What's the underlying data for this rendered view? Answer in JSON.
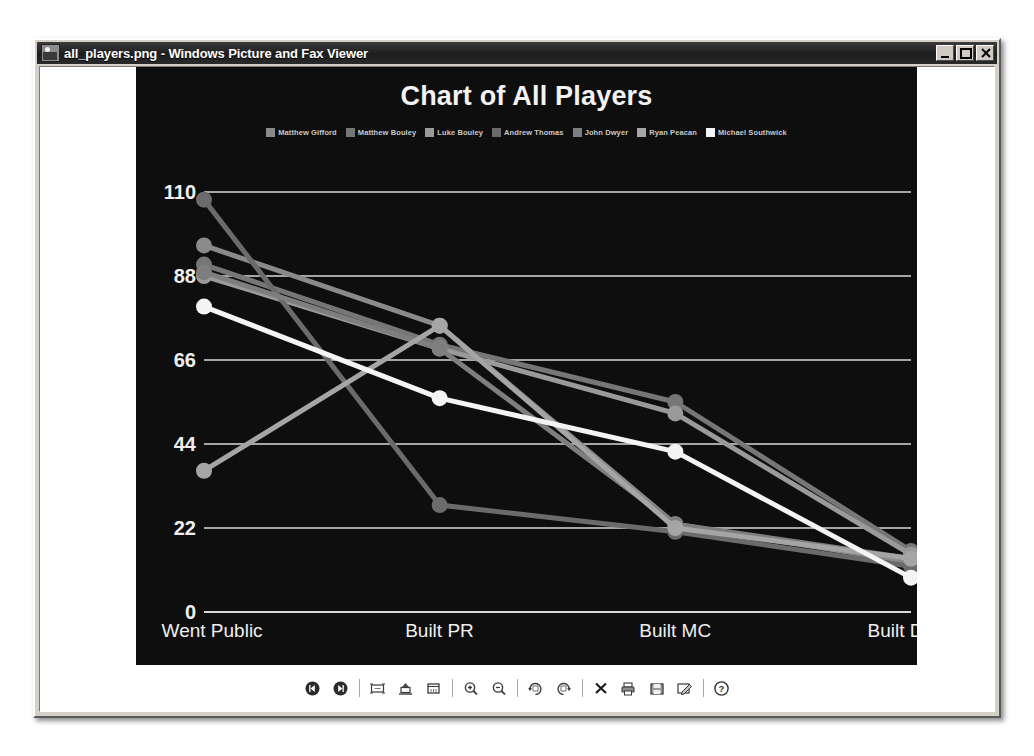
{
  "window": {
    "title": "all_players.png - Windows Picture and Fax Viewer",
    "icon": "image-file-icon",
    "buttons": {
      "minimize": "Minimize",
      "maximize": "Maximize",
      "close": "Close"
    }
  },
  "toolbar": {
    "items": [
      {
        "name": "previous-image-button",
        "label": "Previous Image",
        "icon": "skip-back-icon"
      },
      {
        "name": "next-image-button",
        "label": "Next Image",
        "icon": "skip-forward-icon"
      },
      {
        "name": "separator-1",
        "label": "",
        "icon": "separator"
      },
      {
        "name": "best-fit-button",
        "label": "Best Fit",
        "icon": "best-fit-icon"
      },
      {
        "name": "actual-size-button",
        "label": "Actual Size",
        "icon": "actual-size-icon"
      },
      {
        "name": "start-slideshow-button",
        "label": "Start Slide Show",
        "icon": "slideshow-icon"
      },
      {
        "name": "separator-2",
        "label": "",
        "icon": "separator"
      },
      {
        "name": "zoom-in-button",
        "label": "Zoom In",
        "icon": "magnifier-plus-icon"
      },
      {
        "name": "zoom-out-button",
        "label": "Zoom Out",
        "icon": "magnifier-minus-icon"
      },
      {
        "name": "separator-3",
        "label": "",
        "icon": "separator"
      },
      {
        "name": "rotate-clockwise-button",
        "label": "Rotate Clockwise",
        "icon": "rotate-cw-icon"
      },
      {
        "name": "rotate-counterclockwise-button",
        "label": "Rotate Counter Clockwise",
        "icon": "rotate-ccw-icon"
      },
      {
        "name": "separator-4",
        "label": "",
        "icon": "separator"
      },
      {
        "name": "delete-button",
        "label": "Delete",
        "icon": "close-x-icon"
      },
      {
        "name": "print-button",
        "label": "Print",
        "icon": "printer-icon"
      },
      {
        "name": "copy-to-button",
        "label": "Copy To",
        "icon": "save-disk-icon"
      },
      {
        "name": "edit-button",
        "label": "Edit",
        "icon": "edit-pencil-icon"
      },
      {
        "name": "separator-5",
        "label": "",
        "icon": "separator"
      },
      {
        "name": "help-button",
        "label": "Help",
        "icon": "question-help-icon"
      }
    ]
  },
  "chart_data": {
    "type": "line",
    "title": "Chart of All Players",
    "xlabel": "",
    "ylabel": "",
    "categories": [
      "Went Public",
      "Built PR",
      "Built MC",
      "Built DC"
    ],
    "ylim": [
      0,
      110
    ],
    "yticks": [
      0,
      22,
      44,
      66,
      88,
      110
    ],
    "grid": true,
    "legend_position": "top",
    "background": "#0d0d0d",
    "series": [
      {
        "name": "Matthew Gifford",
        "color": "#8a8a8a",
        "values": [
          96,
          75,
          23,
          13
        ]
      },
      {
        "name": "Matthew Bouley",
        "color": "#767676",
        "values": [
          91,
          70,
          55,
          16
        ]
      },
      {
        "name": "Luke Bouley",
        "color": "#9a9a9a",
        "values": [
          88,
          69,
          52,
          15
        ]
      },
      {
        "name": "Andrew Thomas",
        "color": "#6b6b6b",
        "values": [
          108,
          28,
          21,
          12
        ]
      },
      {
        "name": "John Dwyer",
        "color": "#7e7e7e",
        "values": [
          89,
          69,
          23,
          14
        ]
      },
      {
        "name": "Ryan Peacan",
        "color": "#a5a5a5",
        "values": [
          37,
          75,
          22,
          14
        ]
      },
      {
        "name": "Michael Southwick",
        "color": "#f4f4f4",
        "values": [
          80,
          56,
          42,
          9
        ]
      }
    ]
  }
}
